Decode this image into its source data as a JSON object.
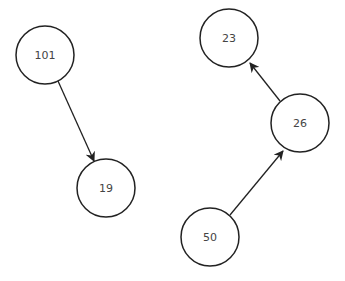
{
  "diagram": {
    "type": "directed-graph",
    "nodes": [
      {
        "id": "n101",
        "label": "101",
        "cx": 45,
        "cy": 55,
        "r": 29
      },
      {
        "id": "n19",
        "label": "19",
        "cx": 106,
        "cy": 188,
        "r": 29
      },
      {
        "id": "n23",
        "label": "23",
        "cx": 229,
        "cy": 38,
        "r": 29
      },
      {
        "id": "n26",
        "label": "26",
        "cx": 300,
        "cy": 123,
        "r": 29
      },
      {
        "id": "n50",
        "label": "50",
        "cx": 210,
        "cy": 237,
        "r": 29
      }
    ],
    "edges": [
      {
        "from": "101",
        "to": "19"
      },
      {
        "from": "26",
        "to": "23"
      },
      {
        "from": "50",
        "to": "26"
      }
    ],
    "colors": {
      "stroke": "#222222",
      "text": "#444444",
      "background": "#ffffff"
    }
  }
}
